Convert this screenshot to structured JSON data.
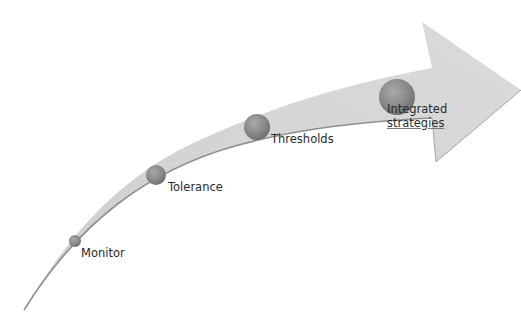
{
  "diagram": {
    "type": "curved-progress-arrow",
    "colors": {
      "arrow_fill": "#d6d6d6",
      "arrow_edge": "#8f8f8f",
      "circle_fill": "#8a8a8a",
      "label_text": "#2a2a2a",
      "background": "#ffffff"
    },
    "steps": [
      {
        "label": "Monitor",
        "order": 1
      },
      {
        "label": "Tolerance",
        "order": 2
      },
      {
        "label": "Thresholds",
        "order": 3
      },
      {
        "label_line1": "Integrated",
        "label_line2": "strategies",
        "order": 4
      }
    ]
  }
}
